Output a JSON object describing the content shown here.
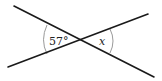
{
  "diagram": {
    "type": "intersecting-lines-angles",
    "colors": {
      "line": "#1a1a1a",
      "arc": "#9a9a9a",
      "text": "#222222",
      "background": "#ffffff"
    },
    "lines": [
      {
        "name": "line-descending",
        "x1": 14,
        "y1": 6,
        "x2": 154,
        "y2": 77
      },
      {
        "name": "line-ascending",
        "x1": 8,
        "y1": 67,
        "x2": 148,
        "y2": 14
      }
    ],
    "intersection": {
      "x": 80,
      "y": 40
    },
    "angles": [
      {
        "name": "left-angle",
        "label": "57°",
        "side": "left"
      },
      {
        "name": "right-angle",
        "label": "x",
        "side": "right"
      }
    ]
  }
}
